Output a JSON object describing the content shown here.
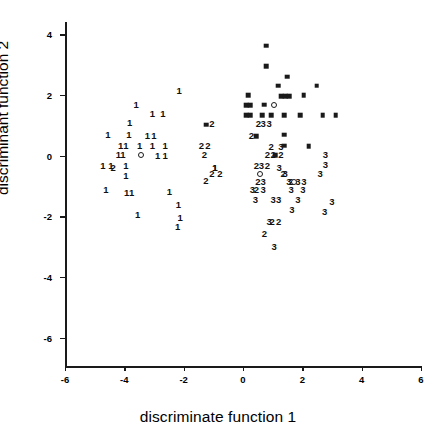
{
  "chart_data": {
    "type": "scatter",
    "title": "",
    "xlabel": "discriminate function 1",
    "ylabel": "discriminant function 2",
    "xlim": [
      -6,
      6
    ],
    "ylim": [
      -7,
      4.4
    ],
    "xticks": [
      -6,
      -4,
      -2,
      0,
      2,
      4,
      6
    ],
    "yticks": [
      4,
      2,
      0,
      -2,
      -4,
      -6
    ],
    "xticklabels": [
      "-6",
      "-4",
      "-2",
      "0",
      "2",
      "4",
      "6"
    ],
    "yticklabels": [
      "4",
      "2",
      "0",
      "-2",
      "-4",
      "-6"
    ],
    "grid": false,
    "legend": null,
    "series": [
      {
        "name": "group 1",
        "marker": "text-1",
        "label": "1",
        "points": [
          [
            -2.15,
            2.12
          ],
          [
            -3.6,
            1.67
          ],
          [
            -3.05,
            1.36
          ],
          [
            -2.7,
            1.36
          ],
          [
            -3.82,
            1.08
          ],
          [
            -4.55,
            0.69
          ],
          [
            -3.85,
            0.69
          ],
          [
            -3.22,
            0.66
          ],
          [
            -3.0,
            0.66
          ],
          [
            -4.12,
            0.33
          ],
          [
            -3.95,
            0.33
          ],
          [
            -3.48,
            0.3
          ],
          [
            -3.05,
            0.3
          ],
          [
            -2.62,
            0.33
          ],
          [
            -4.2,
            0.02
          ],
          [
            -4.05,
            0.02
          ],
          [
            -2.88,
            0.0
          ],
          [
            -2.62,
            0.0
          ],
          [
            -4.72,
            -0.35
          ],
          [
            -4.45,
            -0.35
          ],
          [
            -3.95,
            -0.33
          ],
          [
            -3.95,
            -0.66
          ],
          [
            -4.62,
            -1.15
          ],
          [
            -3.92,
            -1.25
          ],
          [
            -3.75,
            -1.25
          ],
          [
            -2.48,
            -1.2
          ],
          [
            -2.18,
            -1.62
          ],
          [
            -3.55,
            -1.95
          ],
          [
            -2.12,
            -2.05
          ],
          [
            -2.2,
            -2.35
          ],
          [
            -0.95,
            -0.42
          ],
          [
            -0.95,
            -0.42
          ]
        ]
      },
      {
        "name": "group 2",
        "marker": "text-2",
        "label": "2",
        "points": [
          [
            -1.05,
            1.05
          ],
          [
            0.52,
            1.05
          ],
          [
            0.28,
            0.63
          ],
          [
            -1.4,
            0.33
          ],
          [
            -1.18,
            0.33
          ],
          [
            -1.3,
            0.02
          ],
          [
            0.95,
            0.27
          ],
          [
            0.82,
            0.02
          ],
          [
            1.02,
            0.02
          ],
          [
            1.28,
            0.02
          ],
          [
            0.45,
            -0.35
          ],
          [
            0.82,
            -0.35
          ],
          [
            -1.05,
            -0.62
          ],
          [
            -0.78,
            -0.62
          ],
          [
            1.35,
            -0.62
          ],
          [
            -1.25,
            -0.85
          ],
          [
            0.5,
            -0.88
          ],
          [
            1.62,
            -0.88
          ],
          [
            0.45,
            -1.15
          ],
          [
            -4.38,
            -0.42
          ],
          [
            0.98,
            -2.2
          ],
          [
            1.2,
            -2.2
          ],
          [
            0.72,
            -2.58
          ]
        ]
      },
      {
        "name": "group 3",
        "marker": "text-3",
        "label": "3",
        "points": [
          [
            0.68,
            1.05
          ],
          [
            0.88,
            1.05
          ],
          [
            1.28,
            0.27
          ],
          [
            0.62,
            -0.35
          ],
          [
            1.22,
            -0.4
          ],
          [
            1.42,
            -0.62
          ],
          [
            2.6,
            -0.62
          ],
          [
            2.78,
            0.02
          ],
          [
            2.78,
            -0.3
          ],
          [
            0.68,
            -0.88
          ],
          [
            1.55,
            -0.88
          ],
          [
            1.85,
            -0.88
          ],
          [
            2.05,
            -0.88
          ],
          [
            0.32,
            -1.15
          ],
          [
            0.68,
            -1.15
          ],
          [
            1.62,
            -1.15
          ],
          [
            2.02,
            -1.15
          ],
          [
            0.42,
            -1.45
          ],
          [
            1.02,
            -1.45
          ],
          [
            1.2,
            -1.45
          ],
          [
            1.85,
            -1.45
          ],
          [
            3.0,
            -1.52
          ],
          [
            1.65,
            -1.78
          ],
          [
            2.75,
            -1.85
          ],
          [
            0.88,
            -2.2
          ],
          [
            1.05,
            -3.0
          ]
        ]
      },
      {
        "name": "group 4",
        "marker": "filled-square",
        "label": "",
        "points": [
          [
            0.78,
            3.62
          ],
          [
            0.78,
            2.95
          ],
          [
            1.48,
            2.6
          ],
          [
            1.18,
            2.3
          ],
          [
            2.48,
            2.3
          ],
          [
            0.18,
            1.98
          ],
          [
            1.28,
            1.95
          ],
          [
            1.42,
            1.95
          ],
          [
            1.55,
            1.95
          ],
          [
            2.05,
            1.98
          ],
          [
            0.1,
            1.65
          ],
          [
            0.25,
            1.65
          ],
          [
            0.72,
            1.67
          ],
          [
            0.1,
            1.33
          ],
          [
            0.25,
            1.33
          ],
          [
            0.65,
            1.33
          ],
          [
            0.95,
            1.33
          ],
          [
            1.38,
            1.33
          ],
          [
            1.92,
            1.33
          ],
          [
            2.68,
            1.33
          ],
          [
            3.12,
            1.33
          ],
          [
            -1.25,
            1.02
          ],
          [
            0.45,
            0.63
          ],
          [
            1.38,
            0.68
          ],
          [
            1.38,
            0.33
          ],
          [
            2.22,
            0.3
          ],
          [
            1.08,
            0.02
          ]
        ]
      },
      {
        "name": "centroids",
        "marker": "open-circle",
        "label": "",
        "points": [
          [
            -3.45,
            0.03
          ],
          [
            0.58,
            -0.62
          ],
          [
            1.72,
            -0.88
          ],
          [
            1.05,
            1.67
          ]
        ]
      }
    ]
  }
}
